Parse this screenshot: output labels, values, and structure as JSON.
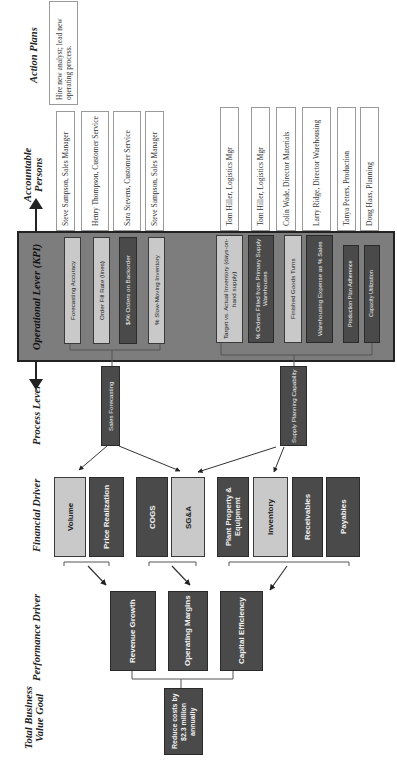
{
  "headers": {
    "action_plans": "Action Plans",
    "accountable_persons": "Accountable Persons",
    "operational_lever": "Operational Lever (KPI)",
    "process_lever": "Process Lever",
    "financial_driver": "Financial Driver",
    "performance_driver": "Performance Driver",
    "total_business_value_goal": "Total Business Value Goal"
  },
  "action_plans": [
    {
      "text": "Hire new analyst; lead new operating process."
    }
  ],
  "accountable_persons": [
    {
      "text": "Steve Sampson, Sales Manager"
    },
    {
      "text": "Henry Thompson, Customer Service"
    },
    {
      "text": "Sara Stevens, Customer Service"
    },
    {
      "text": "Steve Sampson, Sales Manager"
    },
    {
      "text": "Tom Hiller, Logistics Mgr"
    },
    {
      "text": "Tom Hiller, Logistics Mgr"
    },
    {
      "text": "Colin Wade, Director Materials"
    },
    {
      "text": "Larry Ridge, Director Warehousing"
    },
    {
      "text": "Tanya Peters, Production"
    },
    {
      "text": "Doug Haas, Planning"
    }
  ],
  "kpis": [
    {
      "text": "Forecasting Accuracy",
      "style": "light"
    },
    {
      "text": "Order Fill Rate (lines)",
      "style": "light"
    },
    {
      "text": "$/% Orders on Backorder",
      "style": "dark"
    },
    {
      "text": "% Slow-Moving Inventory",
      "style": "light"
    },
    {
      "text": "Target vs. Actual Inventory (days-on-hand supply)",
      "style": "light"
    },
    {
      "text": "% Orders Filled from Primary Supply Warehouses",
      "style": "dark"
    },
    {
      "text": "Finished Goods Turns",
      "style": "light"
    },
    {
      "text": "Warehousing Expense as % Sales",
      "style": "dark"
    },
    {
      "text": "Production Plan Adherence",
      "style": "dark"
    },
    {
      "text": "Capacity Utilization",
      "style": "dark"
    }
  ],
  "process_levers": [
    {
      "text": "Sales Forecasting"
    },
    {
      "text": "Supply Planning Capability"
    }
  ],
  "financial_drivers": [
    {
      "text": "Volume",
      "style": "light"
    },
    {
      "text": "Price Realization",
      "style": "dark"
    },
    {
      "text": "COGS",
      "style": "dark"
    },
    {
      "text": "SG&A",
      "style": "light"
    },
    {
      "text": "Plant Property & Equipment",
      "style": "dark"
    },
    {
      "text": "Inventory",
      "style": "light"
    },
    {
      "text": "Receivables",
      "style": "dark"
    },
    {
      "text": "Payables",
      "style": "dark"
    }
  ],
  "performance_drivers": [
    {
      "text": "Revenue Growth"
    },
    {
      "text": "Operating Margins"
    },
    {
      "text": "Capital Efficiency"
    }
  ],
  "goal": {
    "text": "Reduce costs by $2.3 million annually"
  },
  "colors": {
    "dark_box": "#4a4a4a",
    "light_box": "#c9c9c9",
    "kpi_frame": "#7d7d7d",
    "border": "#222222"
  }
}
